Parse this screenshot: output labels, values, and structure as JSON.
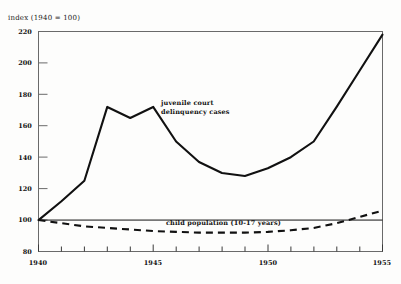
{
  "figure": {
    "axis_note": "index (1940 = 100)",
    "background_color": "#fdfdfc",
    "ink_color": "#111111"
  },
  "chart_data": {
    "type": "line",
    "title": "",
    "subtitle": "",
    "xlabel": "",
    "ylabel": "index (1940 = 100)",
    "xlim": [
      1940,
      1955
    ],
    "ylim": [
      80,
      220
    ],
    "grid": false,
    "legend_position": "inline-annotations",
    "y_ticks": [
      80,
      100,
      120,
      140,
      160,
      180,
      200,
      220
    ],
    "y_tick_labels": [
      "80",
      "100",
      "120",
      "140",
      "160",
      "180",
      "200",
      "220"
    ],
    "x_ticks": [
      1940,
      1941,
      1942,
      1943,
      1944,
      1945,
      1946,
      1947,
      1948,
      1949,
      1950,
      1951,
      1952,
      1953,
      1954,
      1955
    ],
    "x_tick_labels_shown": [
      "1940",
      "1945",
      "1950",
      "1955"
    ],
    "x_labeled_ticks": [
      1940,
      1945,
      1950,
      1955
    ],
    "x": [
      1940,
      1941,
      1942,
      1943,
      1944,
      1945,
      1946,
      1947,
      1948,
      1949,
      1950,
      1951,
      1952,
      1953,
      1954,
      1955
    ],
    "series": [
      {
        "name": "juvenile court delinquency cases",
        "style": "solid",
        "color": "#111111",
        "label_text_line1": "juvenile court",
        "label_text_line2": "delinquency cases",
        "values": [
          100,
          112,
          125,
          172,
          165,
          172,
          150,
          137,
          130,
          128,
          133,
          140,
          150,
          172,
          195,
          218
        ]
      },
      {
        "name": "child population (10-17 years)",
        "style": "dashed",
        "color": "#111111",
        "label_text_line1": "child population (10-17 years)",
        "values": [
          100,
          98,
          96,
          95,
          94,
          93,
          92.5,
          92,
          92,
          92,
          92.5,
          93.5,
          95,
          98,
          102,
          106
        ]
      }
    ],
    "reference_line": {
      "name": "index base line",
      "value": 100,
      "style": "solid-thin"
    },
    "annotations": [
      {
        "text": "index (1940 = 100)",
        "position": "above-y-axis"
      },
      {
        "text": "juvenile court delinquency cases",
        "position": "upper-middle"
      },
      {
        "text": "child population (10-17 years)",
        "position": "lower-middle"
      }
    ]
  }
}
